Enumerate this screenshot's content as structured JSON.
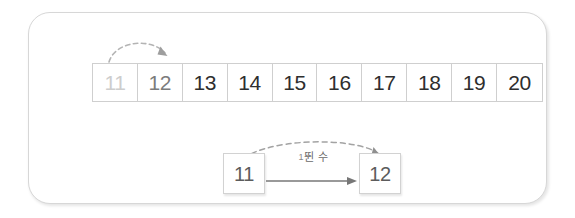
{
  "card": {
    "accent_color": "#d7d7d7",
    "background": "#ffffff"
  },
  "number_strip": {
    "name": "number-line-11-to-20",
    "cells": [
      {
        "value": "11",
        "tone": "dim"
      },
      {
        "value": "12",
        "tone": "mid"
      },
      {
        "value": "13",
        "tone": "normal"
      },
      {
        "value": "14",
        "tone": "normal"
      },
      {
        "value": "15",
        "tone": "normal"
      },
      {
        "value": "16",
        "tone": "normal"
      },
      {
        "value": "17",
        "tone": "normal"
      },
      {
        "value": "18",
        "tone": "normal"
      },
      {
        "value": "19",
        "tone": "normal"
      },
      {
        "value": "20",
        "tone": "normal"
      }
    ],
    "tone_colors": {
      "dim": "#cdcdcd",
      "mid": "#7c7c7c",
      "normal": "#2e2e2e"
    }
  },
  "top_arrow": {
    "name": "jump-arrow-11-to-12",
    "style": "dashed-curved",
    "color": "#b0b0b0",
    "from_label": "11",
    "to_label": "12"
  },
  "equation": {
    "from_box": {
      "value": "11"
    },
    "to_box": {
      "value": "12"
    },
    "operation_label": {
      "lead": "1",
      "text": "뛴 수"
    },
    "arc": {
      "style": "dashed-curved",
      "color": "#9e9e9e"
    },
    "line": {
      "style": "solid-arrow",
      "color": "#6e6e6e"
    }
  }
}
